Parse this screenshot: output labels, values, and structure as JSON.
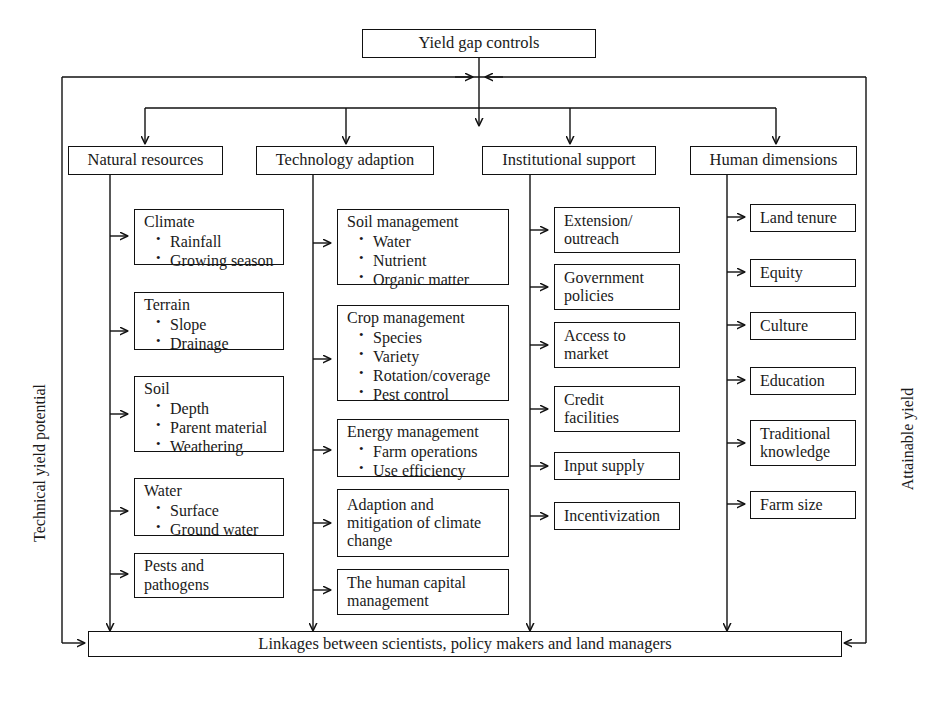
{
  "diagram": {
    "root": {
      "label": "Yield gap controls"
    },
    "side_labels": {
      "left": "Technical yield potential",
      "right": "Attainable yield"
    },
    "bottom_bar": {
      "label": "Linkages between scientists, policy makers and land managers"
    },
    "columns": [
      {
        "id": "natural-resources",
        "header": "Natural resources",
        "items": [
          {
            "heading": "Climate",
            "bullets": [
              "Rainfall",
              "Growing season"
            ]
          },
          {
            "heading": "Terrain",
            "bullets": [
              "Slope",
              "Drainage"
            ]
          },
          {
            "heading": "Soil",
            "bullets": [
              "Depth",
              "Parent material",
              "Weathering"
            ]
          },
          {
            "heading": "Water",
            "bullets": [
              "Surface",
              "Ground water"
            ]
          },
          {
            "heading": "Pests and\npathogens",
            "bullets": []
          }
        ]
      },
      {
        "id": "technology-adaption",
        "header": "Technology adaption",
        "items": [
          {
            "heading": "Soil management",
            "bullets": [
              "Water",
              "Nutrient",
              "Organic matter"
            ]
          },
          {
            "heading": "Crop management",
            "bullets": [
              "Species",
              "Variety",
              "Rotation/coverage",
              "Pest control"
            ]
          },
          {
            "heading": "Energy management",
            "bullets": [
              "Farm operations",
              "Use efficiency"
            ]
          },
          {
            "heading": "Adaption and\nmitigation of climate\nchange",
            "bullets": []
          },
          {
            "heading": "The human capital\nmanagement",
            "bullets": []
          }
        ]
      },
      {
        "id": "institutional-support",
        "header": "Institutional support",
        "items": [
          {
            "heading": "Extension/\noutreach",
            "bullets": []
          },
          {
            "heading": "Government\npolicies",
            "bullets": []
          },
          {
            "heading": "Access to\nmarket",
            "bullets": []
          },
          {
            "heading": "Credit\nfacilities",
            "bullets": []
          },
          {
            "heading": "Input supply",
            "bullets": []
          },
          {
            "heading": "Incentivization",
            "bullets": []
          }
        ]
      },
      {
        "id": "human-dimensions",
        "header": "Human dimensions",
        "items": [
          {
            "heading": "Land tenure",
            "bullets": []
          },
          {
            "heading": "Equity",
            "bullets": []
          },
          {
            "heading": "Culture",
            "bullets": []
          },
          {
            "heading": "Education",
            "bullets": []
          },
          {
            "heading": "Traditional\nknowledge",
            "bullets": []
          },
          {
            "heading": "Farm size",
            "bullets": []
          }
        ]
      }
    ],
    "colors": {
      "stroke": "#111111",
      "background": "#ffffff",
      "text": "#1a1a1a"
    }
  }
}
